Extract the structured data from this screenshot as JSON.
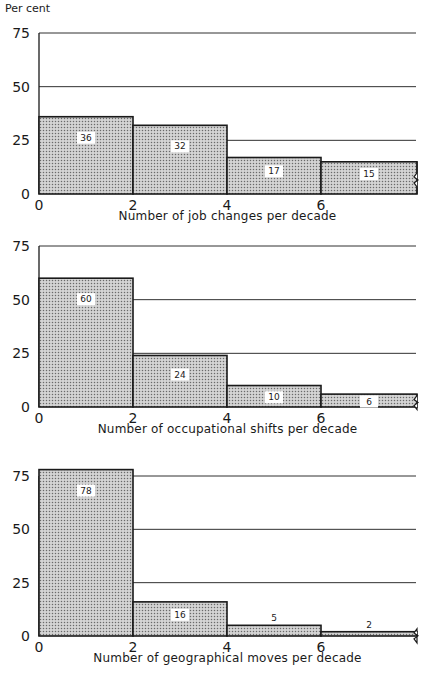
{
  "y_axis_label": "Per cent",
  "chart_data": [
    {
      "type": "bar",
      "title": "",
      "xlabel": "Number of job changes per decade",
      "ylabel": "Per cent",
      "categories": [
        "0-2",
        "2-4",
        "4-6",
        "6+"
      ],
      "values": [
        36,
        32,
        17,
        15
      ],
      "x_ticks": [
        "0",
        "2",
        "4",
        "6"
      ],
      "y_ticks": [
        "0",
        "25",
        "50",
        "75"
      ],
      "ylim": [
        0,
        75
      ],
      "grid": true
    },
    {
      "type": "bar",
      "title": "",
      "xlabel": "Number of occupational shifts per decade",
      "ylabel": "Per cent",
      "categories": [
        "0-2",
        "2-4",
        "4-6",
        "6+"
      ],
      "values": [
        60,
        24,
        10,
        6
      ],
      "x_ticks": [
        "0",
        "2",
        "4",
        "6"
      ],
      "y_ticks": [
        "0",
        "25",
        "50",
        "75"
      ],
      "ylim": [
        0,
        75
      ],
      "grid": true
    },
    {
      "type": "bar",
      "title": "",
      "xlabel": "Number of geographical moves per decade",
      "ylabel": "Per cent",
      "categories": [
        "0-2",
        "2-4",
        "4-6",
        "6+"
      ],
      "values": [
        78,
        16,
        5,
        2
      ],
      "x_ticks": [
        "0",
        "2",
        "4",
        "6"
      ],
      "y_ticks": [
        "0",
        "25",
        "50",
        "75"
      ],
      "ylim": [
        0,
        75
      ],
      "grid": true
    }
  ],
  "style": {
    "bar_fill": "#d4d4d4",
    "dot_color": "#6a6a6a",
    "line_color": "#1a1a1a"
  }
}
